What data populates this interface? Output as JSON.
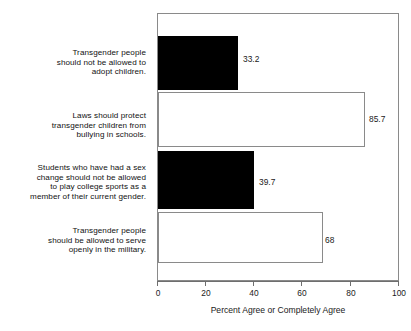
{
  "chart_data": {
    "type": "bar",
    "orientation": "horizontal",
    "title": "",
    "xlabel": "Percent Agree or Completely Agree",
    "ylabel": "",
    "xlim": [
      0,
      100
    ],
    "xticks": [
      0,
      20,
      40,
      60,
      80,
      100
    ],
    "xtick_labels": [
      "0",
      "20",
      "40",
      "60",
      "80",
      "100"
    ],
    "grid": false,
    "legend": null,
    "categories": [
      "Transgender people should not be allowed to adopt children.",
      "Laws should protect transgender children from bullying in schools.",
      "Students who have had a sex change should not be allowed to play college sports as a member of their current gender.",
      "Transgender people should be allowed to serve openly in the military."
    ],
    "values": [
      33.2,
      85.7,
      39.7,
      68
    ],
    "value_labels": [
      "33.2",
      "85.7",
      "39.7",
      "68"
    ],
    "bar_styles": [
      "filled",
      "open",
      "filled",
      "open"
    ],
    "colors": {
      "filled": "#000000",
      "open": "#ffffff",
      "border": "#8a8a8a",
      "axis": "#6e6e6e",
      "text": "#1a1a1a"
    }
  },
  "category_label_lines": [
    [
      "Transgender people",
      "should not be allowed to",
      "adopt children."
    ],
    [
      "Laws should protect",
      "transgender children from",
      "bullying in schools."
    ],
    [
      "Students who have had a sex",
      "change should not be allowed",
      "to play college sports as a",
      "member of their current gender."
    ],
    [
      "Transgender people",
      "should be allowed to serve",
      "openly in the military."
    ]
  ]
}
